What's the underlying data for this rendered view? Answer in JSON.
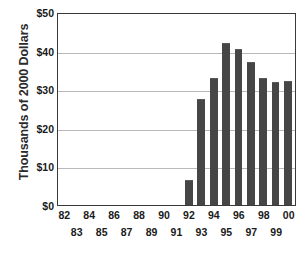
{
  "chart_data": {
    "type": "bar",
    "title": "",
    "xlabel": "",
    "ylabel": "Thousands of 2000 Dollars",
    "ylim": [
      0,
      50
    ],
    "ytick_labels": [
      "$50",
      "$40",
      "$30",
      "$20",
      "$10",
      "$0"
    ],
    "ytick_values": [
      50,
      40,
      30,
      20,
      10,
      0
    ],
    "grid": true,
    "legend": "none",
    "bar_color": "#464646",
    "gridline_color": "#b9b9b9",
    "axis_color": "#3a3a3a",
    "categories": [
      "82",
      "83",
      "84",
      "85",
      "86",
      "87",
      "88",
      "89",
      "90",
      "91",
      "92",
      "93",
      "94",
      "95",
      "96",
      "97",
      "98",
      "99",
      "00"
    ],
    "category_label_rows": [
      "top",
      "bottom",
      "top",
      "bottom",
      "top",
      "bottom",
      "top",
      "bottom",
      "top",
      "bottom",
      "top",
      "bottom",
      "top",
      "bottom",
      "top",
      "bottom",
      "top",
      "bottom",
      "top"
    ],
    "values": [
      null,
      null,
      null,
      null,
      null,
      null,
      null,
      null,
      null,
      null,
      6.5,
      27.5,
      32.8,
      42.0,
      40.5,
      37.0,
      32.9,
      31.8,
      32.2
    ]
  }
}
